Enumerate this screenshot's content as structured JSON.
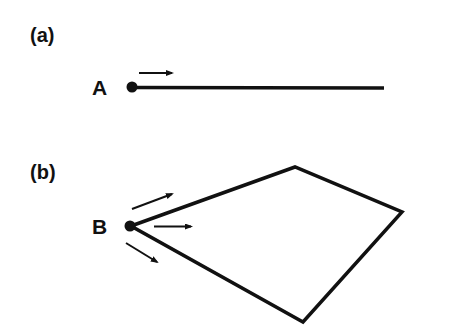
{
  "panels": [
    {
      "id": "a",
      "label": "(a)",
      "point_label": "A",
      "description": "Point A at left end of a straight line segment, arrow pointing right along the line"
    },
    {
      "id": "b",
      "label": "(b)",
      "point_label": "B",
      "description": "Point B at left vertex of a quadrilateral, three arrows pointing outward into the shape"
    }
  ],
  "colors": {
    "stroke": "#111111",
    "background": "#ffffff"
  }
}
